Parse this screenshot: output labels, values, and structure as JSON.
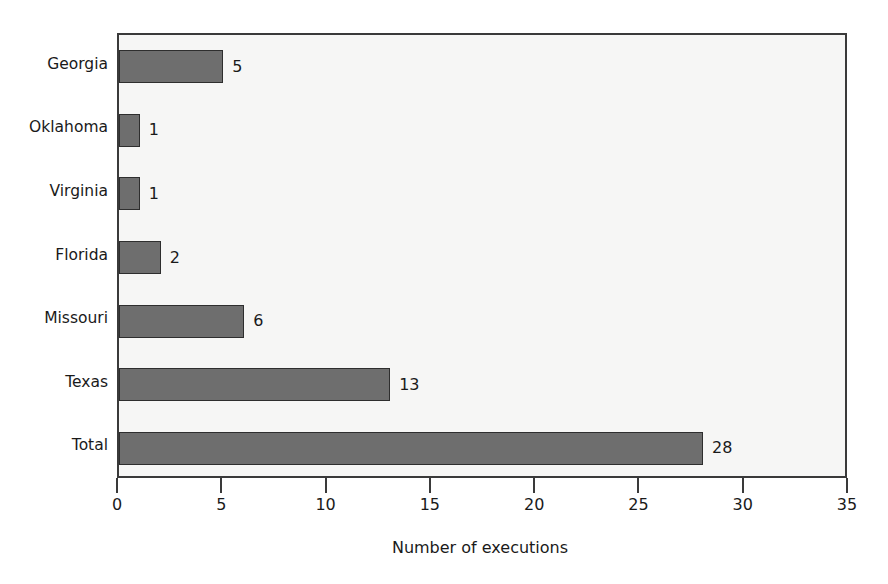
{
  "chart_data": {
    "type": "bar",
    "orientation": "horizontal",
    "title": "",
    "subtitle": "",
    "xlabel": "Number of executions",
    "ylabel": "",
    "categories": [
      "Georgia",
      "Oklahoma",
      "Virginia",
      "Florida",
      "Missouri",
      "Texas",
      "Total"
    ],
    "values": [
      5,
      1,
      1,
      2,
      6,
      13,
      28
    ],
    "value_labels": [
      "5",
      "1",
      "1",
      "2",
      "6",
      "13",
      "28"
    ],
    "xlim": [
      0,
      35
    ],
    "ylim": null,
    "xticks": [
      0,
      5,
      10,
      15,
      20,
      25,
      30,
      35
    ],
    "xtick_labels": [
      "0",
      "5",
      "10",
      "15",
      "20",
      "25",
      "30",
      "35"
    ],
    "grid": false,
    "legend": null,
    "legend_position": "none",
    "series": [
      {
        "name": "Number of executions",
        "values": [
          5,
          1,
          1,
          2,
          6,
          13,
          28
        ]
      }
    ],
    "colors": {
      "bar_fill": "#6e6e6e",
      "bar_stroke": "#2e2e2e",
      "plot_background": "#f6f6f5",
      "axis": "#3a3a3a",
      "text": "#1a1a1a",
      "page_background": "#ffffff"
    }
  }
}
